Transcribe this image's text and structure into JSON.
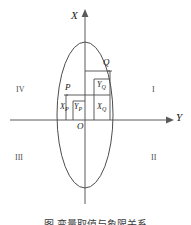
{
  "figure": {
    "axes": {
      "x_axis_label": "X",
      "y_axis_label": "Y",
      "origin_label": "O"
    },
    "quadrants": [
      {
        "key": "upper-left",
        "label": "IV"
      },
      {
        "key": "upper-right",
        "label": "I"
      },
      {
        "key": "lower-left",
        "label": "III"
      },
      {
        "key": "lower-right",
        "label": "II"
      }
    ],
    "points": [
      {
        "key": "P",
        "label": "P"
      },
      {
        "key": "Q",
        "label": "Q"
      }
    ],
    "components": [
      {
        "key": "x_p",
        "base": "X",
        "sub": "P"
      },
      {
        "key": "y_p",
        "base": "Y",
        "sub": "P"
      },
      {
        "key": "x_q",
        "base": "X",
        "sub": "Q"
      },
      {
        "key": "y_q",
        "base": "Y",
        "sub": "Q"
      }
    ],
    "caption": "图   变量取值与象限关系",
    "colors": {
      "stroke": "#4d4d4d",
      "axis": "#5a5a5a",
      "text": "#1a1a1a",
      "quadrant_text": "#4a4a4a",
      "background": "#ffffff"
    }
  }
}
